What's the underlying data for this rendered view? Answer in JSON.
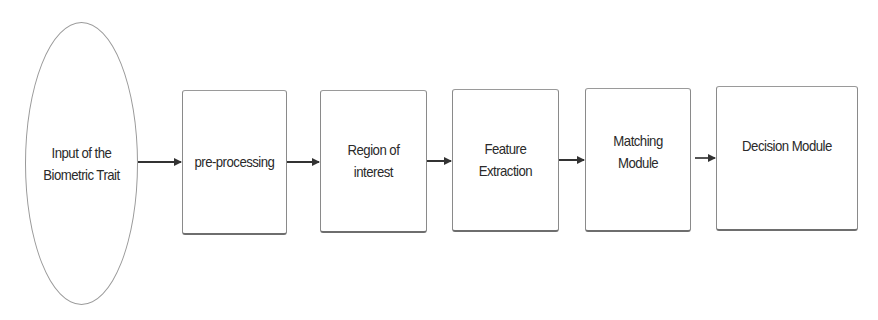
{
  "diagram": {
    "type": "flowchart",
    "direction": "left-to-right",
    "nodes": [
      {
        "id": "input",
        "shape": "ellipse",
        "label": "Input of the\nBiometric Trait"
      },
      {
        "id": "preprocessing",
        "shape": "rect",
        "label": "pre-processing"
      },
      {
        "id": "roi",
        "shape": "rect",
        "label": "Region of\ninterest"
      },
      {
        "id": "feature",
        "shape": "rect",
        "label": "Feature\nExtraction"
      },
      {
        "id": "matching",
        "shape": "rect",
        "label": "Matching\nModule"
      },
      {
        "id": "decision",
        "shape": "rect",
        "label": "Decision Module"
      }
    ],
    "edges": [
      {
        "from": "input",
        "to": "preprocessing"
      },
      {
        "from": "preprocessing",
        "to": "roi"
      },
      {
        "from": "roi",
        "to": "feature"
      },
      {
        "from": "feature",
        "to": "matching"
      },
      {
        "from": "matching",
        "to": "decision"
      }
    ],
    "colors": {
      "stroke": "#8a8a8a",
      "text": "#2a2a2a",
      "arrow": "#333333",
      "background": "#ffffff"
    }
  }
}
